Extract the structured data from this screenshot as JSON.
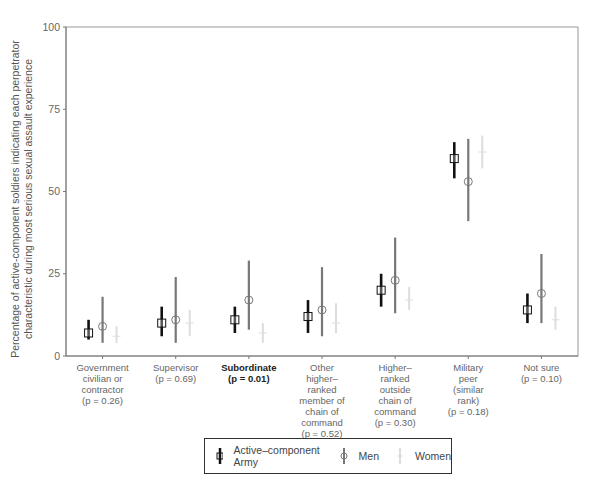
{
  "chart_data": {
    "type": "errorbar",
    "title": "",
    "ylabel": "Percentage of active-component soldiers indicating each perpetrator characteristic during most serious sexual assault experience",
    "xlabel": "",
    "ylim": [
      0,
      100
    ],
    "yticks": [
      0,
      25,
      50,
      75,
      100
    ],
    "grid": false,
    "legend_position": "bottom",
    "categories": [
      {
        "label": "Government\ncivilian or\ncontractor\n(p = 0.26)",
        "bold": false
      },
      {
        "label": "Supervisor\n(p = 0.69)",
        "bold": false
      },
      {
        "label": "Subordinate\n(p = 0.01)",
        "bold": true
      },
      {
        "label": "Other\nhigher–\nranked\nmember of\nchain of\ncommand\n(p = 0.52)",
        "bold": false
      },
      {
        "label": "Higher–\nranked\noutside\nchain of\ncommand\n(p = 0.30)",
        "bold": false
      },
      {
        "label": "Military\npeer\n(similar\nrank)\n(p = 0.18)",
        "bold": false
      },
      {
        "label": "Not sure\n(p = 0.10)",
        "bold": false
      }
    ],
    "series": [
      {
        "name": "Active–component Army",
        "color": "#111111",
        "marker": "square",
        "values": [
          7,
          10,
          11,
          12,
          20,
          60,
          14
        ],
        "lower": [
          5,
          6,
          7,
          7,
          15,
          54,
          10
        ],
        "upper": [
          11,
          15,
          15,
          17,
          25,
          65,
          19
        ]
      },
      {
        "name": "Men",
        "color": "#777777",
        "marker": "circle",
        "values": [
          9,
          11,
          17,
          14,
          23,
          53,
          19
        ],
        "lower": [
          4,
          4,
          8,
          6,
          13,
          41,
          10
        ],
        "upper": [
          18,
          24,
          29,
          27,
          36,
          66,
          31
        ]
      },
      {
        "name": "Women",
        "color": "#dddddd",
        "marker": "cross",
        "values": [
          6,
          10,
          7,
          10,
          17,
          62,
          11
        ],
        "lower": [
          4,
          6,
          4,
          7,
          14,
          57,
          8
        ],
        "upper": [
          9,
          14,
          10,
          16,
          21,
          67,
          15
        ]
      }
    ]
  },
  "legend": {
    "items": [
      {
        "label": "Active–component Army"
      },
      {
        "label": "Men"
      },
      {
        "label": "Women"
      }
    ]
  }
}
